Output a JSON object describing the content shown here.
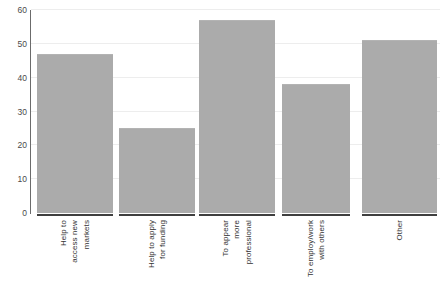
{
  "chart_data": {
    "type": "bar",
    "title": "",
    "subtitle": "",
    "xlabel": "",
    "ylabel": "",
    "ylim": [
      0,
      60
    ],
    "yticks": [
      0,
      10,
      20,
      30,
      40,
      50,
      60
    ],
    "grid": true,
    "legend": "none",
    "orientation": "vertical",
    "bar_color": "#ababab",
    "categories": [
      "Help to access new markets",
      "Help to apply for funding",
      "To appear more professional",
      "To employ/work with others",
      "Other"
    ],
    "category_label_lines": [
      [
        "Help to",
        "access new",
        "markets"
      ],
      [
        "Help to apply",
        "for funding"
      ],
      [
        "To appear",
        "more",
        "professional"
      ],
      [
        "To employ/work",
        "with others"
      ],
      [
        "Other"
      ]
    ],
    "values": [
      47,
      25,
      57,
      38,
      51
    ]
  },
  "axis": {
    "tick_labels": [
      "0",
      "10",
      "20",
      "30",
      "40",
      "50",
      "60"
    ]
  }
}
